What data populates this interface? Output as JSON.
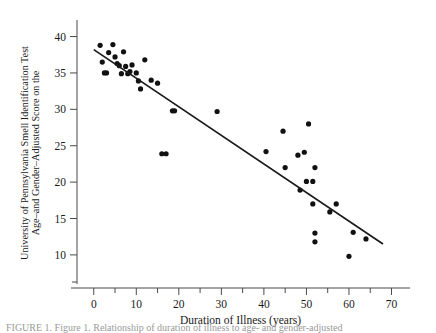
{
  "figure": {
    "caption_partial": "FIGURE 1. Figure 1. Relationship of duration of illness to age- and gender-adjusted"
  },
  "chart_data": {
    "type": "scatter",
    "title": "",
    "xlabel": "Duration of Illness (years)",
    "ylabel_line1": "Age–and Gender–Adjusted Score on the",
    "ylabel_line2": "University of Pennsylvania Smell Identification Test",
    "xlim": [
      -3,
      72
    ],
    "ylim": [
      6,
      42
    ],
    "xticks": [
      0,
      10,
      20,
      30,
      40,
      50,
      60,
      70
    ],
    "xtick_labels": [
      "0",
      "10",
      "20",
      "30",
      "40",
      "50",
      "60",
      "70"
    ],
    "xminor_ticks": [
      5,
      15,
      25,
      35,
      45,
      55,
      65
    ],
    "yticks": [
      10,
      15,
      20,
      25,
      30,
      35,
      40
    ],
    "ytick_labels": [
      "10",
      "15",
      "20",
      "25",
      "30",
      "35",
      "40"
    ],
    "grid": false,
    "legend": null,
    "marker": "filled-circle",
    "marker_color": "#111111",
    "points": [
      [
        1.5,
        38.8
      ],
      [
        2.0,
        36.5
      ],
      [
        2.5,
        35.0
      ],
      [
        3.0,
        35.0
      ],
      [
        3.5,
        37.8
      ],
      [
        4.5,
        38.9
      ],
      [
        5.0,
        37.2
      ],
      [
        5.5,
        36.3
      ],
      [
        6.0,
        36.0
      ],
      [
        6.5,
        34.9
      ],
      [
        7.0,
        37.9
      ],
      [
        7.5,
        35.9
      ],
      [
        8.0,
        34.9
      ],
      [
        8.5,
        35.2
      ],
      [
        9.0,
        36.1
      ],
      [
        10.0,
        35.0
      ],
      [
        10.5,
        33.9
      ],
      [
        11.0,
        32.8
      ],
      [
        12.0,
        36.8
      ],
      [
        13.5,
        34.0
      ],
      [
        15.0,
        33.6
      ],
      [
        16.0,
        23.9
      ],
      [
        17.0,
        23.9
      ],
      [
        18.5,
        29.8
      ],
      [
        19.0,
        29.8
      ],
      [
        29.0,
        29.7
      ],
      [
        40.5,
        24.2
      ],
      [
        44.5,
        27.0
      ],
      [
        45.0,
        22.0
      ],
      [
        48.0,
        23.7
      ],
      [
        48.5,
        18.9
      ],
      [
        49.5,
        24.1
      ],
      [
        50.0,
        20.1
      ],
      [
        50.5,
        28.0
      ],
      [
        51.5,
        20.1
      ],
      [
        51.5,
        17.0
      ],
      [
        52.0,
        22.0
      ],
      [
        52.0,
        13.0
      ],
      [
        52.0,
        11.8
      ],
      [
        55.5,
        15.9
      ],
      [
        57.0,
        17.0
      ],
      [
        60.0,
        9.8
      ],
      [
        61.0,
        13.1
      ],
      [
        64.0,
        12.2
      ]
    ],
    "fit_line": {
      "label": "least-squares regression line",
      "x_start": 0,
      "y_start": 38.2,
      "x_end": 68,
      "y_end": 11.5
    }
  }
}
